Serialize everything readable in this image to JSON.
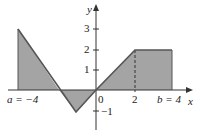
{
  "figure": {
    "type": "function-graph-with-shaded-area",
    "axis_labels": {
      "x": "x",
      "y": "y"
    },
    "x_ticks": [
      {
        "value": 0,
        "label": "0"
      },
      {
        "value": 2,
        "label": "2"
      }
    ],
    "y_ticks": [
      {
        "value": 3,
        "label": "3"
      },
      {
        "value": 2,
        "label": "2"
      },
      {
        "value": 1,
        "label": "1"
      },
      {
        "value": -1,
        "label": "−1"
      }
    ],
    "endpoint_labels": {
      "a": "a = −4",
      "b": "b = 4"
    },
    "function_points": [
      [
        -4,
        3
      ],
      [
        -1,
        -1
      ],
      [
        0,
        0
      ],
      [
        2,
        2
      ],
      [
        4,
        2
      ]
    ],
    "dashed_line_at_x": 2,
    "colors": {
      "shade": "#9e9e9e",
      "line": "#5a5a5a",
      "axis": "#333333"
    }
  }
}
